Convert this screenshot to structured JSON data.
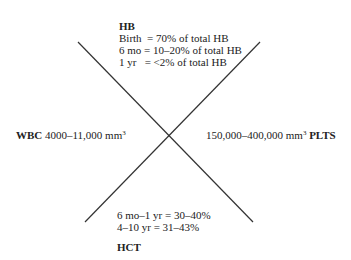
{
  "diagram": {
    "type": "fishbone-cross",
    "line_color": "#333333",
    "top": {
      "title": "HB",
      "lines": [
        "Birth  = 70% of total HB",
        "6 mo = 10–20% of total HB",
        "1 yr   = <2% of total HB"
      ]
    },
    "left": {
      "label": "WBC",
      "value": "4000–11,000 mm",
      "exponent": "3"
    },
    "right": {
      "value": "150,000–400,000 mm",
      "exponent": "3",
      "label": "PLTS"
    },
    "bottom": {
      "lines": [
        "6 mo–1 yr = 30–40%",
        "4–10 yr = 31–43%"
      ],
      "title": "HCT"
    }
  }
}
